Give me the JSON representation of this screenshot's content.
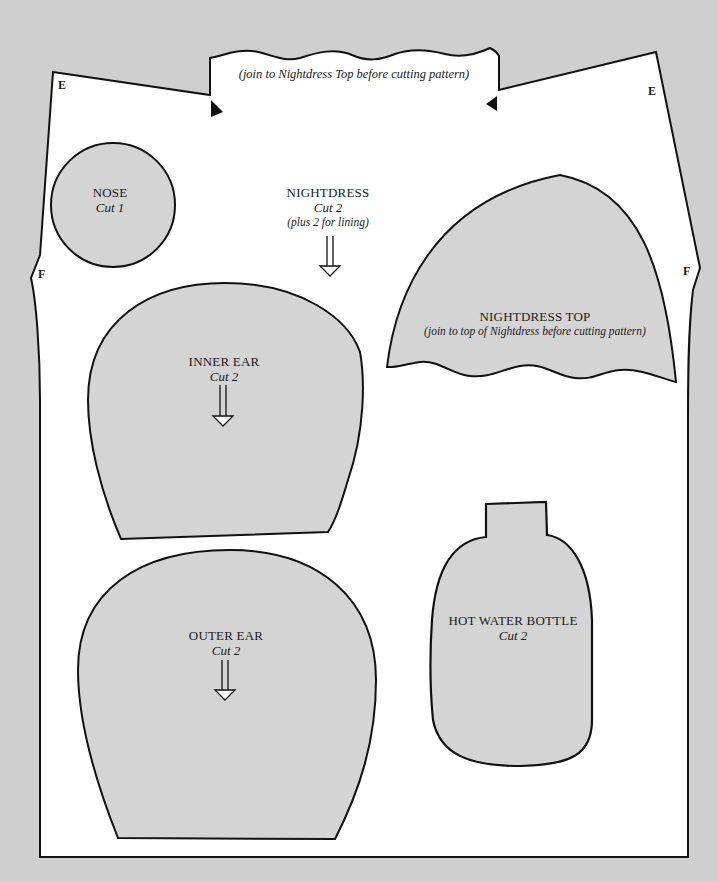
{
  "page": {
    "background_color": "#cfcfcf",
    "paper_color": "#ffffff",
    "piece_fill_color": "#d4d4d4",
    "outline_color": "#111111"
  },
  "nightdress": {
    "join_note": "(join to Nightdress Top before cutting pattern)",
    "title": "NIGHTDRESS",
    "cut": "Cut 2",
    "extra": "(plus 2 for lining)",
    "markers": {
      "top_left": "E",
      "top_right": "E",
      "side_left": "F",
      "side_right": "F"
    }
  },
  "pieces": {
    "nose": {
      "title": "NOSE",
      "cut": "Cut 1"
    },
    "nightdress_top": {
      "title": "NIGHTDRESS TOP",
      "note": "(join to top of Nightdress before cutting pattern)"
    },
    "inner_ear": {
      "title": "INNER EAR",
      "cut": "Cut 2"
    },
    "outer_ear": {
      "title": "OUTER EAR",
      "cut": "Cut 2"
    },
    "hot_water_bottle": {
      "title": "HOT WATER BOTTLE",
      "cut": "Cut 2"
    }
  },
  "icons": {
    "grain_arrow": "down-arrow-grainline",
    "notch": "triangle-notch"
  }
}
